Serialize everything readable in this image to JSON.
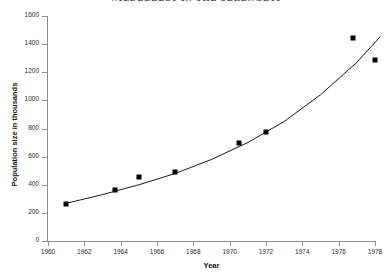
{
  "chart_data": {
    "type": "scatter",
    "title": "WILDEBEEST IN THE SERENGETI",
    "xlabel": "Year",
    "ylabel": "Population size in thousands",
    "xlim": [
      1960,
      1978
    ],
    "ylim": [
      0,
      1600
    ],
    "xticks": [
      1960,
      1962,
      1964,
      1966,
      1968,
      1970,
      1972,
      1974,
      1976,
      1978
    ],
    "yticks": [
      0,
      200,
      400,
      600,
      800,
      1000,
      1200,
      1400,
      1600
    ],
    "grid": false,
    "legend": "none",
    "marker": "square",
    "marker_color": "#000000",
    "line_color": "#000000",
    "x": [
      1961,
      1963.7,
      1965,
      1967,
      1970.5,
      1972,
      1976.8,
      1978
    ],
    "values": [
      263,
      360,
      455,
      490,
      700,
      775,
      1445,
      1290
    ],
    "series": [
      {
        "name": "Wildebeest population",
        "points": [
          {
            "x": 1961,
            "y": 263
          },
          {
            "x": 1963.7,
            "y": 360
          },
          {
            "x": 1965,
            "y": 455
          },
          {
            "x": 1967,
            "y": 490
          },
          {
            "x": 1970.5,
            "y": 700
          },
          {
            "x": 1972,
            "y": 775
          },
          {
            "x": 1976.8,
            "y": 1445
          },
          {
            "x": 1978,
            "y": 1290
          }
        ]
      },
      {
        "name": "Fitted exponential trend",
        "type": "line",
        "points": [
          {
            "x": 1961,
            "y": 268
          },
          {
            "x": 1963,
            "y": 330
          },
          {
            "x": 1965,
            "y": 400
          },
          {
            "x": 1967,
            "y": 480
          },
          {
            "x": 1969,
            "y": 580
          },
          {
            "x": 1971,
            "y": 700
          },
          {
            "x": 1973,
            "y": 850
          },
          {
            "x": 1975,
            "y": 1040
          },
          {
            "x": 1977,
            "y": 1270
          },
          {
            "x": 1978.3,
            "y": 1455
          }
        ]
      }
    ]
  },
  "axes": {
    "x_title": "Year",
    "y_title": "Population size in thousands",
    "x_tick_labels": [
      "1960",
      "1962",
      "1964",
      "1966",
      "1968",
      "1970",
      "1972",
      "1974",
      "1976",
      "1978"
    ],
    "y_tick_labels": [
      "0",
      "200",
      "400",
      "600",
      "800",
      "1000",
      "1200",
      "1400",
      "1600"
    ]
  },
  "header": {
    "title": "WILDEBEEST IN THE SERENGETI"
  }
}
